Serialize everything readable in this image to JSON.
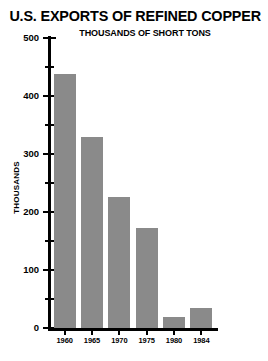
{
  "chart_data": {
    "type": "bar",
    "title": "U.S. EXPORTS OF REFINED COPPER",
    "subtitle": "THOUSANDS OF SHORT TONS",
    "xlabel": "",
    "ylabel": "THOUSANDS",
    "categories": [
      "1960",
      "1965",
      "1970",
      "1975",
      "1980",
      "1984"
    ],
    "values": [
      438,
      329,
      226,
      172,
      19,
      34
    ],
    "ylim": [
      0,
      500
    ],
    "ytick_labels": [
      "500",
      "400",
      "300",
      "200",
      "100",
      "0"
    ],
    "ytick_values": [
      500,
      400,
      300,
      200,
      100,
      0
    ],
    "yminor_values": [
      450,
      350,
      250,
      150,
      50
    ],
    "grid": false,
    "legend": false,
    "bar_color": "#8a8a8a",
    "axis_color": "#000000",
    "background_color": "#ffffff"
  }
}
